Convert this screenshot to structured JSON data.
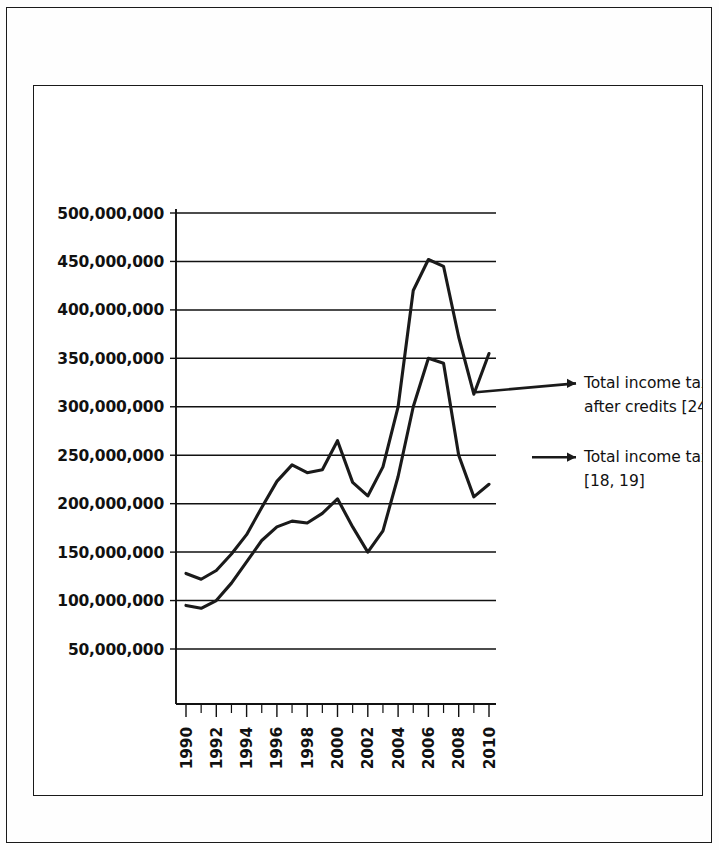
{
  "chart_data": {
    "type": "line",
    "title": "",
    "xlabel": "",
    "ylabel": "",
    "x": [
      1990,
      1991,
      1992,
      1993,
      1994,
      1995,
      1996,
      1997,
      1998,
      1999,
      2000,
      2001,
      2002,
      2003,
      2004,
      2005,
      2006,
      2007,
      2008,
      2009,
      2010
    ],
    "xlim": [
      1990,
      2010
    ],
    "ylim": [
      0,
      500000000
    ],
    "y_tick_values": [
      50000000,
      100000000,
      150000000,
      200000000,
      250000000,
      300000000,
      350000000,
      400000000,
      450000000,
      500000000
    ],
    "y_tick_labels": [
      "50,000,000",
      "100,000,000",
      "150,000,000",
      "200,000,000",
      "250,000,000",
      "300,000,000",
      "350,000,000",
      "400,000,000",
      "450,000,000",
      "500,000,000"
    ],
    "x_tick_labels": [
      "1990",
      "1992",
      "1994",
      "1996",
      "1998",
      "2000",
      "2002",
      "2004",
      "2006",
      "2008",
      "2010"
    ],
    "x_minor_ticks_every": 1,
    "grid": true,
    "grid_axis": "y",
    "legend_position": "right-callout",
    "line_color": "#1a1a1a",
    "series": [
      {
        "name": "Total income tax after credits [24]",
        "label_lines": [
          "Total income tax",
          "after credits [24]"
        ],
        "values": [
          128000000,
          122000000,
          131000000,
          148000000,
          168000000,
          196000000,
          223000000,
          240000000,
          232000000,
          235000000,
          265000000,
          222000000,
          208000000,
          238000000,
          300000000,
          420000000,
          452000000,
          445000000,
          372000000,
          313000000,
          355000000
        ]
      },
      {
        "name": "Total income tax [18, 19]",
        "label_lines": [
          "Total income tax",
          "[18, 19]"
        ],
        "values": [
          95000000,
          92000000,
          100000000,
          118000000,
          140000000,
          162000000,
          176000000,
          182000000,
          180000000,
          190000000,
          205000000,
          176000000,
          150000000,
          172000000,
          228000000,
          300000000,
          350000000,
          345000000,
          250000000,
          207000000,
          220000000
        ]
      }
    ]
  },
  "axis": {
    "y_labels": [
      "500,000,000",
      "450,000,000",
      "400,000,000",
      "350,000,000",
      "300,000,000",
      "250,000,000",
      "200,000,000",
      "150,000,000",
      "100,000,000",
      "50,000,000"
    ],
    "x_labels": [
      "1990",
      "1992",
      "1994",
      "1996",
      "1998",
      "2000",
      "2002",
      "2004",
      "2006",
      "2008",
      "2010"
    ]
  },
  "legend": {
    "items": [
      {
        "line1": "Total income tax",
        "line2": "after credits [24]"
      },
      {
        "line1": "Total income tax",
        "line2": "[18, 19]"
      }
    ]
  }
}
